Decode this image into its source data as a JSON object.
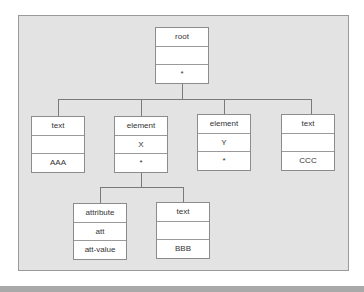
{
  "diagram": {
    "type": "tree",
    "colors": {
      "frame_bg": "#e3e3e3",
      "node_bg": "#ffffff",
      "line": "#7a7a7a",
      "bottom_band": "#a9a9a9"
    },
    "root": {
      "rows": [
        "root",
        "",
        "*"
      ]
    },
    "level1": [
      {
        "id": "text-aaa",
        "rows": [
          "text",
          "",
          "AAA"
        ]
      },
      {
        "id": "element-x",
        "rows": [
          "element",
          "X",
          "*"
        ]
      },
      {
        "id": "element-y",
        "rows": [
          "element",
          "Y",
          "*"
        ]
      },
      {
        "id": "text-ccc",
        "rows": [
          "text",
          "",
          "CCC"
        ]
      }
    ],
    "level2": [
      {
        "id": "attribute-att",
        "rows": [
          "attribute",
          "att",
          "att-value"
        ]
      },
      {
        "id": "text-bbb",
        "rows": [
          "text",
          "",
          "BBB"
        ]
      }
    ]
  }
}
